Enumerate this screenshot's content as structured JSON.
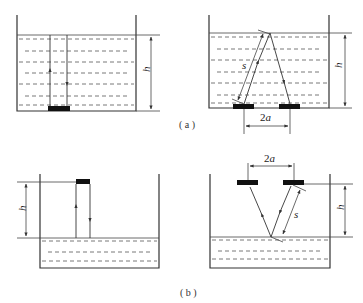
{
  "figure": {
    "panels": [
      {
        "id": "a",
        "caption": "( a )",
        "subfigures": [
          {
            "name": "a-left",
            "description": "Transducer at tank bottom, vertical emission/echo through liquid",
            "labels": {
              "height": "h"
            }
          },
          {
            "name": "a-right",
            "description": "Separate transmitter/receiver at bottom, slant path reflecting at liquid surface",
            "labels": {
              "height": "h",
              "path": "s",
              "spacing": "2a"
            }
          }
        ]
      },
      {
        "id": "b",
        "caption": "( b )",
        "subfigures": [
          {
            "name": "b-left",
            "description": "Transducer above tank, vertical emission/echo to liquid surface",
            "labels": {
              "height": "h"
            }
          },
          {
            "name": "b-right",
            "description": "Separate transmitter/receiver above tank, slant path reflecting at liquid surface",
            "labels": {
              "height": "h",
              "path": "s",
              "spacing": "2a"
            }
          }
        ]
      }
    ]
  }
}
